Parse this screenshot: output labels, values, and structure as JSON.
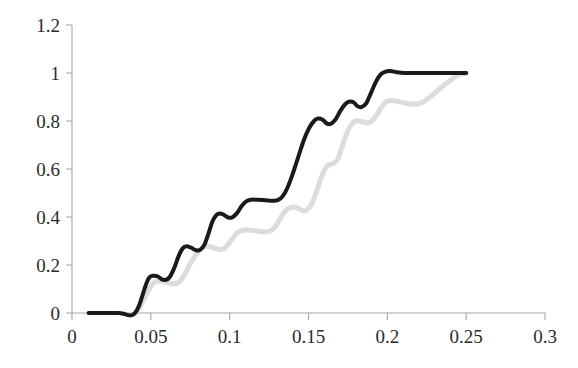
{
  "chart_data": {
    "type": "line",
    "title": "",
    "subtitle": "",
    "xlabel": "",
    "ylabel": "",
    "xlim": [
      0,
      0.3
    ],
    "ylim": [
      0,
      1.2
    ],
    "grid": false,
    "legend": "none",
    "x_ticks": [
      0,
      0.05,
      0.1,
      0.15,
      0.2,
      0.25,
      0.3
    ],
    "x_tick_labels": [
      "0",
      "0.05",
      "0.1",
      "0.15",
      "0.2",
      "0.25",
      "0.3"
    ],
    "y_ticks": [
      0,
      0.2,
      0.4,
      0.6,
      0.8,
      1,
      1.2
    ],
    "y_tick_labels": [
      "0",
      "0.2",
      "0.4",
      "0.6",
      "0.8",
      "1",
      "1.2"
    ],
    "series": [
      {
        "name": "black-curve",
        "color": "#1a1a1a",
        "stroke_width": 4.0,
        "points": [
          [
            0.0105,
            0.0
          ],
          [
            0.015,
            0.0
          ],
          [
            0.02,
            0.0
          ],
          [
            0.025,
            0.0
          ],
          [
            0.0295,
            0.0
          ],
          [
            0.032,
            -0.002
          ],
          [
            0.035,
            -0.008
          ],
          [
            0.0375,
            -0.01
          ],
          [
            0.04,
            0.0
          ],
          [
            0.0425,
            0.03
          ],
          [
            0.045,
            0.08
          ],
          [
            0.047,
            0.12
          ],
          [
            0.049,
            0.148
          ],
          [
            0.0515,
            0.155
          ],
          [
            0.0545,
            0.152
          ],
          [
            0.057,
            0.14
          ],
          [
            0.0595,
            0.138
          ],
          [
            0.062,
            0.15
          ],
          [
            0.065,
            0.19
          ],
          [
            0.0675,
            0.235
          ],
          [
            0.07,
            0.268
          ],
          [
            0.0725,
            0.278
          ],
          [
            0.0755,
            0.272
          ],
          [
            0.0785,
            0.262
          ],
          [
            0.081,
            0.262
          ],
          [
            0.084,
            0.285
          ],
          [
            0.0865,
            0.33
          ],
          [
            0.089,
            0.38
          ],
          [
            0.0915,
            0.408
          ],
          [
            0.094,
            0.415
          ],
          [
            0.0965,
            0.408
          ],
          [
            0.099,
            0.398
          ],
          [
            0.1015,
            0.398
          ],
          [
            0.1045,
            0.415
          ],
          [
            0.1075,
            0.445
          ],
          [
            0.1105,
            0.465
          ],
          [
            0.1135,
            0.472
          ],
          [
            0.1175,
            0.472
          ],
          [
            0.1225,
            0.47
          ],
          [
            0.127,
            0.468
          ],
          [
            0.1305,
            0.47
          ],
          [
            0.1335,
            0.485
          ],
          [
            0.1365,
            0.52
          ],
          [
            0.14,
            0.58
          ],
          [
            0.1435,
            0.65
          ],
          [
            0.147,
            0.72
          ],
          [
            0.1505,
            0.772
          ],
          [
            0.1535,
            0.8
          ],
          [
            0.156,
            0.81
          ],
          [
            0.159,
            0.805
          ],
          [
            0.1615,
            0.79
          ],
          [
            0.164,
            0.788
          ],
          [
            0.167,
            0.805
          ],
          [
            0.17,
            0.84
          ],
          [
            0.173,
            0.868
          ],
          [
            0.1755,
            0.88
          ],
          [
            0.1785,
            0.878
          ],
          [
            0.181,
            0.862
          ],
          [
            0.1835,
            0.858
          ],
          [
            0.1865,
            0.872
          ],
          [
            0.1895,
            0.915
          ],
          [
            0.1925,
            0.96
          ],
          [
            0.1955,
            0.992
          ],
          [
            0.1985,
            1.005
          ],
          [
            0.202,
            1.008
          ],
          [
            0.206,
            1.003
          ],
          [
            0.211,
            1.0
          ],
          [
            0.22,
            1.0
          ],
          [
            0.23,
            1.0
          ],
          [
            0.24,
            1.0
          ],
          [
            0.25,
            1.0
          ]
        ]
      },
      {
        "name": "gray-curve",
        "color": "#dcdcdc",
        "stroke_width": 5.0,
        "points": [
          [
            0.039,
            -0.005
          ],
          [
            0.042,
            0.015
          ],
          [
            0.045,
            0.05
          ],
          [
            0.048,
            0.09
          ],
          [
            0.051,
            0.12
          ],
          [
            0.0535,
            0.132
          ],
          [
            0.0565,
            0.133
          ],
          [
            0.06,
            0.128
          ],
          [
            0.064,
            0.122
          ],
          [
            0.067,
            0.125
          ],
          [
            0.07,
            0.145
          ],
          [
            0.073,
            0.18
          ],
          [
            0.0765,
            0.222
          ],
          [
            0.08,
            0.255
          ],
          [
            0.083,
            0.272
          ],
          [
            0.086,
            0.278
          ],
          [
            0.0895,
            0.272
          ],
          [
            0.093,
            0.265
          ],
          [
            0.096,
            0.268
          ],
          [
            0.099,
            0.285
          ],
          [
            0.102,
            0.312
          ],
          [
            0.105,
            0.335
          ],
          [
            0.1085,
            0.345
          ],
          [
            0.1125,
            0.345
          ],
          [
            0.117,
            0.342
          ],
          [
            0.1215,
            0.338
          ],
          [
            0.125,
            0.34
          ],
          [
            0.128,
            0.352
          ],
          [
            0.131,
            0.382
          ],
          [
            0.134,
            0.415
          ],
          [
            0.137,
            0.435
          ],
          [
            0.14,
            0.442
          ],
          [
            0.143,
            0.438
          ],
          [
            0.146,
            0.428
          ],
          [
            0.1485,
            0.428
          ],
          [
            0.1515,
            0.448
          ],
          [
            0.1545,
            0.495
          ],
          [
            0.1575,
            0.555
          ],
          [
            0.1605,
            0.6
          ],
          [
            0.163,
            0.618
          ],
          [
            0.1655,
            0.622
          ],
          [
            0.1685,
            0.64
          ],
          [
            0.171,
            0.688
          ],
          [
            0.174,
            0.745
          ],
          [
            0.177,
            0.785
          ],
          [
            0.18,
            0.8
          ],
          [
            0.1835,
            0.798
          ],
          [
            0.187,
            0.792
          ],
          [
            0.19,
            0.8
          ],
          [
            0.193,
            0.822
          ],
          [
            0.196,
            0.855
          ],
          [
            0.199,
            0.878
          ],
          [
            0.202,
            0.885
          ],
          [
            0.206,
            0.882
          ],
          [
            0.211,
            0.875
          ],
          [
            0.216,
            0.87
          ],
          [
            0.22,
            0.872
          ],
          [
            0.224,
            0.885
          ],
          [
            0.228,
            0.905
          ],
          [
            0.232,
            0.928
          ],
          [
            0.236,
            0.95
          ],
          [
            0.24,
            0.97
          ],
          [
            0.244,
            0.988
          ],
          [
            0.247,
            0.996
          ],
          [
            0.25,
            1.0
          ]
        ]
      }
    ]
  }
}
